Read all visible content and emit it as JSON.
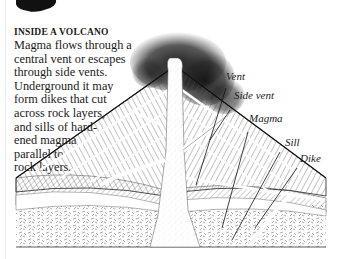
{
  "caption": {
    "title": "INSIDE A VOLCANO",
    "body": "Magma flows through a\ncentral vent or escapes\nthrough side vents.\nUnderground it may\nform dikes that cut\nacross rock layers,\nand sills of hard-\nened magma\nparallel  to\nrock layers."
  },
  "diagram": {
    "labels": [
      {
        "id": "vent",
        "text": "Vent"
      },
      {
        "id": "side-vent",
        "text": "Side vent"
      },
      {
        "id": "magma",
        "text": "Magma"
      },
      {
        "id": "sill",
        "text": "Sill"
      },
      {
        "id": "dike",
        "text": "Dike"
      }
    ],
    "colors": {
      "ink": "#1a1a1a",
      "paper": "#ffffff",
      "smoke": "#2a2a2a"
    }
  }
}
